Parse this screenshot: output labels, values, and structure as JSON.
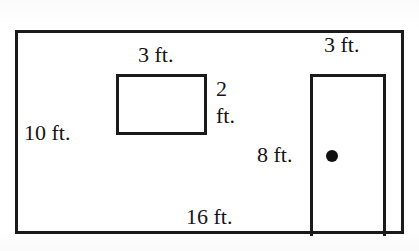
{
  "figure": {
    "type": "geometry-diagram",
    "background_color": "#ffffff",
    "stroke_color": "#1a1a1a"
  },
  "shapes": {
    "outer_room": {
      "name": "outer-room-rectangle",
      "width_label": "16 ft.",
      "height_label": "10 ft."
    },
    "inner_box": {
      "name": "inner-rectangle",
      "width_label": "3 ft.",
      "height_label_line1": "2",
      "height_label_line2": "ft."
    },
    "door": {
      "name": "door-opening",
      "width_label": "3 ft.",
      "height_label": "8 ft.",
      "knob": "doorknob-dot"
    }
  },
  "labels": {
    "inner_top": "3 ft.",
    "door_top": "3 ft.",
    "room_left": "10 ft.",
    "room_bottom": "16 ft.",
    "door_left": "8 ft.",
    "inner_right_value": "2",
    "inner_right_unit": "ft."
  },
  "measurements": {
    "room_width_ft": 16,
    "room_height_ft": 10,
    "inner_width_ft": 3,
    "inner_height_ft": 2,
    "door_width_ft": 3,
    "door_height_ft": 8
  }
}
